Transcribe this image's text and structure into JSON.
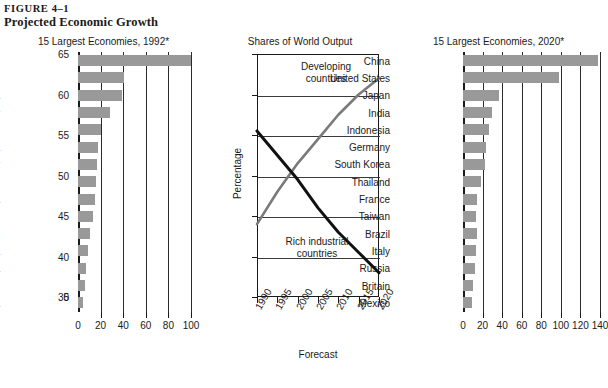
{
  "figure": {
    "number": "FIGURE 4–1",
    "title": "Projected Economic Growth"
  },
  "panel_left": {
    "title": "15 Largest Economies, 1992*"
  },
  "panel_middle": {
    "title": "Shares of World Output"
  },
  "panel_right": {
    "title": "15 Largest Economies, 2020*"
  },
  "chart_data": [
    {
      "type": "bar",
      "orientation": "horizontal",
      "title": "15 Largest Economies, 1992*",
      "xlabel": "",
      "ylabel": "",
      "xlim": [
        0,
        100
      ],
      "xticks": [
        0,
        20,
        40,
        60,
        80,
        100
      ],
      "grid": true,
      "bar_color": "#999999",
      "categories": [
        "United States",
        "Japan",
        "China",
        "Germany",
        "France",
        "India",
        "Italy",
        "Britain",
        "Russia",
        "Brazil",
        "Mexico",
        "Indonesia",
        "Canada",
        "Spain",
        "South Korea"
      ],
      "values": [
        100,
        41,
        39,
        28,
        20,
        18,
        17,
        16,
        15,
        13,
        11,
        9,
        7,
        6,
        4
      ]
    },
    {
      "type": "line",
      "title": "Shares of World Output",
      "xlabel": "Forecast",
      "ylabel": "Percentage",
      "ylim": [
        35,
        65
      ],
      "yticks": [
        35,
        40,
        45,
        50,
        55,
        60,
        65
      ],
      "y_origin_label": "0",
      "xlim": [
        1990,
        2020
      ],
      "xticks": [
        1990,
        1995,
        2000,
        2005,
        2010,
        2015,
        2020
      ],
      "grid": true,
      "legend_position": "inline-annotations",
      "series": [
        {
          "name": "Developing countries",
          "color": "#7a7a7a",
          "x": [
            1990,
            1995,
            2000,
            2005,
            2010,
            2015,
            2020
          ],
          "values": [
            44,
            48,
            51.5,
            54.5,
            57.5,
            60,
            62
          ]
        },
        {
          "name": "Rich industrial countries",
          "color": "#111111",
          "x": [
            1990,
            1995,
            2000,
            2005,
            2010,
            2015,
            2020
          ],
          "values": [
            55.5,
            52.5,
            49.5,
            46,
            43,
            40.5,
            38
          ]
        }
      ],
      "annotations": [
        {
          "text": "Developing countries",
          "x": 2005,
          "y": 63.5
        },
        {
          "text": "Rich industrial countries",
          "x": 2003,
          "y": 37.5
        }
      ]
    },
    {
      "type": "bar",
      "orientation": "horizontal",
      "title": "15 Largest Economies, 2020*",
      "xlabel": "",
      "ylabel": "",
      "xlim": [
        0,
        140
      ],
      "xticks": [
        0,
        20,
        40,
        60,
        80,
        100,
        120,
        140
      ],
      "grid": true,
      "bar_color": "#999999",
      "categories": [
        "China",
        "United States",
        "Japan",
        "India",
        "Indonesia",
        "Germany",
        "South Korea",
        "Thailand",
        "France",
        "Taiwan",
        "Brazil",
        "Italy",
        "Russia",
        "Britain",
        "Mexico"
      ],
      "values": [
        138,
        98,
        37,
        30,
        27,
        24,
        22,
        18,
        14,
        13,
        14,
        13,
        12,
        10,
        9
      ]
    }
  ],
  "left_axis": {
    "ticklabels": [
      "0",
      "20",
      "40",
      "60",
      "80",
      "100"
    ]
  },
  "right_axis": {
    "ticklabels": [
      "0",
      "20",
      "40",
      "60",
      "80",
      "100",
      "120",
      "140"
    ]
  },
  "middle_axis": {
    "yticklabels": [
      "65",
      "60",
      "55",
      "50",
      "45",
      "40",
      "35"
    ],
    "zero_label": "0",
    "xticklabels": [
      "1990",
      "1995",
      "2000",
      "2005",
      "2010",
      "2015",
      "2020"
    ],
    "xtitle": "Forecast",
    "ytitle": "Percentage"
  },
  "middle_annotations": {
    "developing_line1": "Developing",
    "developing_line2": "countries",
    "rich_line1": "Rich industrial",
    "rich_line2": "countries"
  }
}
